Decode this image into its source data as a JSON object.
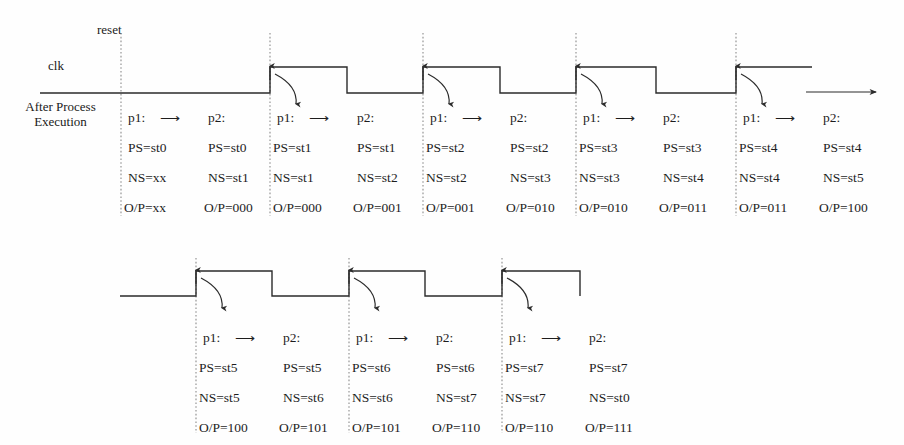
{
  "diagram": {
    "title_labels": {
      "reset": "reset",
      "clk": "clk",
      "after_process_line1": "After Process",
      "after_process_line2": "Execution"
    },
    "process_arrow_label": "⟶",
    "p1_label": "p1:",
    "p2_label": "p2:",
    "rows": [
      {
        "row_index": 0,
        "blocks": [
          {
            "edge_x": 121,
            "has_curve_arrow": false,
            "p1": {
              "head": "p1:",
              "ps": "PS=st0",
              "ns": "NS=xx",
              "op": "O/P=xx"
            },
            "p2": {
              "head": "p2:",
              "ps": "PS=st0",
              "ns": "NS=st1",
              "op": "O/P=000"
            }
          },
          {
            "edge_x": 270,
            "has_curve_arrow": true,
            "p1": {
              "head": "p1:",
              "ps": "PS=st1",
              "ns": "NS=st1",
              "op": "O/P=000"
            },
            "p2": {
              "head": "p2:",
              "ps": "PS=st1",
              "ns": "NS=st2",
              "op": "O/P=001"
            }
          },
          {
            "edge_x": 423,
            "has_curve_arrow": true,
            "p1": {
              "head": "p1:",
              "ps": "PS=st2",
              "ns": "NS=st2",
              "op": "O/P=001"
            },
            "p2": {
              "head": "p2:",
              "ps": "PS=st2",
              "ns": "NS=st3",
              "op": "O/P=010"
            }
          },
          {
            "edge_x": 576,
            "has_curve_arrow": true,
            "p1": {
              "head": "p1:",
              "ps": "PS=st3",
              "ns": "NS=st3",
              "op": "O/P=010"
            },
            "p2": {
              "head": "p2:",
              "ps": "PS=st3",
              "ns": "NS=st4",
              "op": "O/P=011"
            }
          },
          {
            "edge_x": 736,
            "has_curve_arrow": true,
            "p1": {
              "head": "p1:",
              "ps": "PS=st4",
              "ns": "NS=st4",
              "op": "O/P=011"
            },
            "p2": {
              "head": "p2:",
              "ps": "PS=st4",
              "ns": "NS=st5",
              "op": "O/P=100"
            }
          }
        ]
      },
      {
        "row_index": 1,
        "blocks": [
          {
            "edge_x": 196,
            "has_curve_arrow": true,
            "p1": {
              "head": "p1:",
              "ps": "PS=st5",
              "ns": "NS=st5",
              "op": "O/P=100"
            },
            "p2": {
              "head": "p2:",
              "ps": "PS=st5",
              "ns": "NS=st6",
              "op": "O/P=101"
            }
          },
          {
            "edge_x": 349,
            "has_curve_arrow": true,
            "p1": {
              "head": "p1:",
              "ps": "PS=st6",
              "ns": "NS=st6",
              "op": "O/P=101"
            },
            "p2": {
              "head": "p2:",
              "ps": "PS=st6",
              "ns": "NS=st7",
              "op": "O/P=110"
            }
          },
          {
            "edge_x": 502,
            "has_curve_arrow": true,
            "p1": {
              "head": "p1:",
              "ps": "PS=st7",
              "ns": "NS=st7",
              "op": "O/P=110"
            },
            "p2": {
              "head": "p2:",
              "ps": "PS=st7",
              "ns": "NS=st0",
              "op": "O/P=111"
            }
          }
        ]
      }
    ],
    "waveform": {
      "row0_description": "clk low from x=120 to x=270, then square pulses rising at 270, 423, 576, 736",
      "row1_description": "clk low from x=120 to x=196, then square pulses rising at 196, 349, 502",
      "high_y_row0": 67,
      "low_y_row0": 93,
      "high_y_row1": 271,
      "low_y_row1": 296
    },
    "continuation_arrow": {
      "present": true,
      "x_start": 806,
      "x_end": 876,
      "y": 92
    },
    "colors": {
      "ink": "#2b2b2b",
      "text": "#1d1d1d",
      "dotted": "#8a8a8a",
      "background": "#fefefe"
    }
  }
}
